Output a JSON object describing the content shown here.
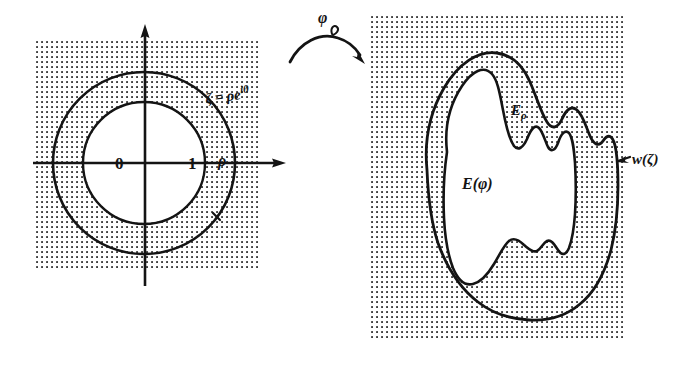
{
  "figure": {
    "background_color": "#ffffff",
    "ink_color": "#141414",
    "stipple_color": "#4a4a4a"
  },
  "left_panel": {
    "name": "zeta-plane",
    "shaded_region": {
      "x": 35,
      "y": 38,
      "width": 223,
      "height": 232
    },
    "disk": {
      "center_x": 144,
      "center_y": 163,
      "inner_radius": 61,
      "outer_radius": 91
    },
    "axis_labels": {
      "origin": "0",
      "unit": "1",
      "outer_radius": "ρ"
    },
    "boundary_label": {
      "symbol": "ζ",
      "equals": "=",
      "expression": "ρe",
      "exponent": "iθ",
      "full": "ζ = ρe^{iθ}"
    },
    "axes": {
      "horizontal": "real-axis",
      "vertical": "imaginary-axis"
    }
  },
  "map_arrow": {
    "name": "phi-map-arrow",
    "label": "φ",
    "direction": "left-to-right"
  },
  "right_panel": {
    "name": "w-plane",
    "shaded_region": {
      "x": 368,
      "y": 14,
      "width": 257,
      "height": 326
    },
    "outer_region_label": {
      "base": "E",
      "subscript": "ρ",
      "full": "Eρ"
    },
    "inner_region_label": {
      "base": "E",
      "argument": "(φ)",
      "full": "E(φ)"
    },
    "boundary_label": {
      "base": "w",
      "argument": "(ζ)",
      "full": "w(ζ)"
    }
  }
}
